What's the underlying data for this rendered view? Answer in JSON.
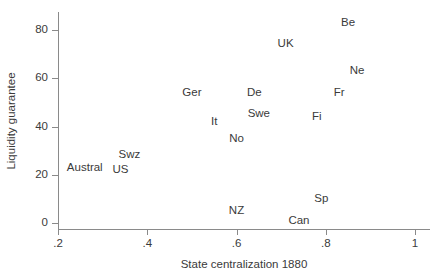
{
  "chart_data": {
    "type": "scatter",
    "title": "",
    "xlabel": "State centralization 1880",
    "ylabel": "Liquidity guarantee",
    "xlim": [
      0.2,
      1.0
    ],
    "ylim": [
      0,
      87
    ],
    "xticks": [
      ".2",
      ".4",
      ".6",
      ".8",
      "1"
    ],
    "xtick_values": [
      0.2,
      0.4,
      0.6,
      0.8,
      1.0
    ],
    "yticks": [
      "0",
      "20",
      "40",
      "60",
      "80"
    ],
    "ytick_values": [
      0,
      20,
      40,
      60,
      80
    ],
    "grid": false,
    "legend": false,
    "marker_style": "text-label-only",
    "points": [
      {
        "label": "Be",
        "x": 0.85,
        "y": 83
      },
      {
        "label": "UK",
        "x": 0.71,
        "y": 74
      },
      {
        "label": "Ne",
        "x": 0.87,
        "y": 63
      },
      {
        "label": "Fr",
        "x": 0.83,
        "y": 54
      },
      {
        "label": "De",
        "x": 0.64,
        "y": 54
      },
      {
        "label": "Ger",
        "x": 0.5,
        "y": 54
      },
      {
        "label": "Fi",
        "x": 0.78,
        "y": 44
      },
      {
        "label": "Swe",
        "x": 0.65,
        "y": 45
      },
      {
        "label": "It",
        "x": 0.55,
        "y": 42
      },
      {
        "label": "No",
        "x": 0.6,
        "y": 35
      },
      {
        "label": "Swz",
        "x": 0.36,
        "y": 28
      },
      {
        "label": "US",
        "x": 0.34,
        "y": 22
      },
      {
        "label": "Austral",
        "x": 0.26,
        "y": 23
      },
      {
        "label": "Sp",
        "x": 0.79,
        "y": 10
      },
      {
        "label": "NZ",
        "x": 0.6,
        "y": 5
      },
      {
        "label": "Can",
        "x": 0.74,
        "y": 1
      }
    ]
  },
  "style": {
    "axis_color": "#8a8a8a",
    "text_color": "#3a3a3a",
    "background": "#ffffff"
  }
}
